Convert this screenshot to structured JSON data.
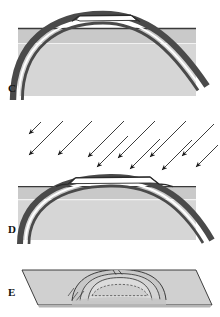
{
  "figure": {
    "title": "Stages in the erosion of a structural dome",
    "background_color": "#ffffff",
    "width": 220,
    "height": 317
  },
  "colors": {
    "page_background": "#ffffff",
    "ground_upper_fill": "#c9c9c9",
    "ground_lower_fill": "#d6d6d6",
    "resistant_bed_dark": "#4a4a4a",
    "resistant_bed_light": "#ffffff",
    "outline_thin": "#2b2b2b",
    "block_top_fill": "#d0d0d0",
    "block_front_fill": "#c2c2c2",
    "label_text": "#111111",
    "arrow_color": "#1a1a1a"
  },
  "panels": [
    {
      "id": "C",
      "label": "C",
      "label_position": {
        "x": 8,
        "y": 84
      },
      "caption": "Cross section of an uplifted dome whose crest has begun to be breached by erosion; the resistant bed arches high above the land surface.",
      "view": "cross-section",
      "ground_surface_y": 28,
      "block": {
        "x": 18,
        "y": 28,
        "width": 178,
        "height": 68
      },
      "dome": {
        "crest_x": 103,
        "crest_y": 14,
        "half_width": 90,
        "breached": true,
        "breach_width": 52
      },
      "arrows": []
    },
    {
      "id": "D",
      "label": "D",
      "label_position": {
        "x": 8,
        "y": 225
      },
      "caption": "Continued erosion attacks the dome; the crest is planed off and the truncated resistant bed now forms a low ridge at the surface.",
      "view": "cross-section",
      "ground_surface_y": 186,
      "block": {
        "x": 18,
        "y": 186,
        "width": 178,
        "height": 54
      },
      "dome": {
        "crest_x": 110,
        "crest_y": 175,
        "half_width": 84,
        "breached": true,
        "breach_width": 70
      },
      "arrows": {
        "count": 7,
        "direction": "down-left",
        "angle_degrees": 225,
        "label": "erosion",
        "length": 46,
        "start_points": [
          {
            "x": 64,
            "y": 122
          },
          {
            "x": 88,
            "y": 122
          },
          {
            "x": 112,
            "y": 122
          },
          {
            "x": 136,
            "y": 122
          },
          {
            "x": 160,
            "y": 122
          },
          {
            "x": 184,
            "y": 122
          },
          {
            "x": 206,
            "y": 126
          }
        ]
      }
    },
    {
      "id": "E",
      "label": "E",
      "label_position": {
        "x": 8,
        "y": 288
      },
      "caption": "Block diagram of the fully breached dome: the eroded structure is expressed at the surface as concentric elliptical ridges around a central basin.",
      "view": "block-diagram",
      "block": {
        "top_left": {
          "x": 22,
          "y": 270
        },
        "top_right": {
          "x": 196,
          "y": 270
        },
        "bottom_right": {
          "x": 212,
          "y": 305
        },
        "bottom_left": {
          "x": 38,
          "y": 305
        }
      },
      "structure": {
        "type": "concentric-elliptical-ridges",
        "ring_count": 3,
        "center": {
          "x": 112,
          "y": 291
        }
      },
      "arrows": []
    }
  ],
  "legend": {
    "resistant_bed_label": "resistant bed",
    "land_surface_label": "land surface"
  }
}
